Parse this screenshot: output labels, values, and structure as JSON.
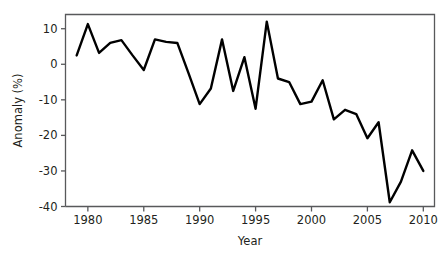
{
  "chart_data": {
    "type": "line",
    "title": "",
    "xlabel": "Year",
    "ylabel": "Anomaly (%)",
    "xlim": [
      1978.0,
      2011.0
    ],
    "ylim": [
      -40,
      14
    ],
    "xticks": [
      1980,
      1985,
      1990,
      1995,
      2000,
      2005,
      2010
    ],
    "xtick_labels": [
      "1980",
      "1985",
      "1990",
      "1995",
      "2000",
      "2005",
      "2010"
    ],
    "yticks": [
      10,
      0,
      -10,
      -20,
      -30,
      -40
    ],
    "ytick_labels": [
      "10",
      "0",
      "-10",
      "-20",
      "-30",
      "-40"
    ],
    "grid": false,
    "legend": null,
    "line_color": "#000000",
    "axis_color": "#58595b",
    "background_color": "#ffffff",
    "x": [
      1979,
      1980,
      1981,
      1982,
      1983,
      1984,
      1985,
      1986,
      1987,
      1988,
      1989,
      1990,
      1991,
      1992,
      1993,
      1994,
      1995,
      1996,
      1997,
      1998,
      1999,
      2000,
      2001,
      2002,
      2003,
      2004,
      2005,
      2006,
      2007,
      2008,
      2009,
      2010
    ],
    "values": [
      2.5,
      11.3,
      3.2,
      6.0,
      6.8,
      2.5,
      -1.6,
      7.0,
      6.3,
      6.0,
      -2.5,
      -11.2,
      -6.8,
      7.0,
      -7.5,
      2.0,
      -12.5,
      12.0,
      -4.0,
      -5.0,
      -11.2,
      -10.5,
      -4.5,
      -15.5,
      -12.8,
      -14.0,
      -20.8,
      -16.3,
      -38.8,
      -33.0,
      -24.2,
      -30.0
    ],
    "series_name": "Anomaly"
  },
  "axis": {
    "y_title": "Anomaly (%)",
    "x_title": "Year"
  }
}
